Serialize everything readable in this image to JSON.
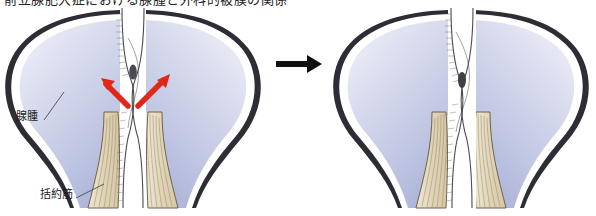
{
  "figure": {
    "title_clipped": "前立腺肥大症における腺腫と外科的被膜の関係",
    "labels": {
      "adenoma": "腺腫",
      "sphincter": "括約筋"
    },
    "transition_arrow": "right-arrow",
    "panels": [
      {
        "id": "before",
        "name": "before-state",
        "force_arrows": 2,
        "force_arrow_color": "#e02718",
        "lumen_state": "open"
      },
      {
        "id": "after",
        "name": "after-state",
        "force_arrows": 0,
        "lumen_state": "closed"
      }
    ]
  },
  "colors": {
    "lobe_fill_light": "#eceef8",
    "lobe_fill_mid": "#c6cbe6",
    "lobe_fill_deep": "#aab2d8",
    "outline": "#2b2b33",
    "capsule_white": "#ffffff",
    "muscle_fill": "#e3d8bf",
    "muscle_line": "#8d7f5e",
    "lesion": "#4a4a52",
    "arrow_red": "#e02718",
    "arrow_black": "#101010"
  }
}
